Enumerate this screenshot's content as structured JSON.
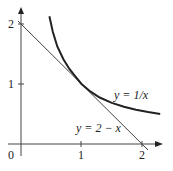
{
  "diagram": {
    "axes": {
      "origin_label": "0",
      "x_ticks": [
        "1",
        "2"
      ],
      "y_ticks": [
        "1",
        "2"
      ]
    },
    "curves": [
      {
        "name": "hyperbola",
        "label": "y = 1/x",
        "color": "#222222"
      },
      {
        "name": "tangent-line",
        "label": "y = 2 − x",
        "color": "#444444"
      }
    ]
  }
}
